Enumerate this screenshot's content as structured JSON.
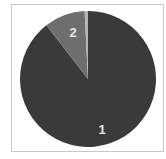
{
  "chart_data": {
    "type": "pie",
    "title": "",
    "categories": [
      "1",
      "2",
      "3"
    ],
    "values": [
      89.5,
      9.7,
      0.8
    ],
    "colors": [
      "#3a3a3a",
      "#6e6e6e",
      "#b4b4b4"
    ],
    "labels_shown": [
      "1",
      "2"
    ],
    "start_angle": "12 o'clock, clockwise",
    "legend": "none",
    "frame_border": "#c8c8c8"
  },
  "labels": {
    "slice1": "1",
    "slice2": "2"
  }
}
